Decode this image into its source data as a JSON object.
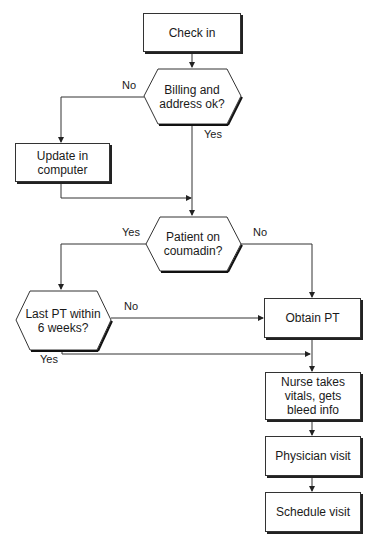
{
  "nodes": {
    "check_in": "Check in",
    "billing": "Billing and address ok?",
    "update": "Update in computer",
    "coumadin": "Patient on coumadin?",
    "last_pt": "Last PT within 6 weeks?",
    "obtain_pt": "Obtain PT",
    "nurse": "Nurse takes vitals, gets bleed info",
    "physician": "Physician visit",
    "schedule": "Schedule visit"
  },
  "edges": {
    "billing_no": "No",
    "billing_yes": "Yes",
    "coumadin_yes": "Yes",
    "coumadin_no": "No",
    "last_pt_no": "No",
    "last_pt_yes": "Yes"
  }
}
